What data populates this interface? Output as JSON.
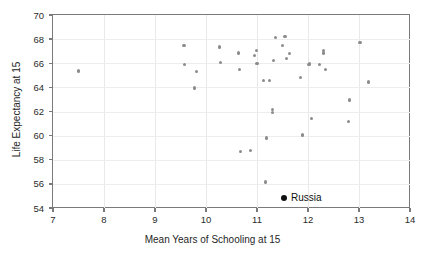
{
  "chart_data": {
    "type": "scatter",
    "title": "",
    "xlabel": "Mean Years of Schooling at 15",
    "ylabel": "Life Expectancy at 15",
    "xlim": [
      7,
      14
    ],
    "ylim": [
      54,
      70
    ],
    "xticks": [
      7,
      8,
      9,
      10,
      11,
      12,
      13,
      14
    ],
    "yticks": [
      54,
      56,
      58,
      60,
      62,
      64,
      66,
      68,
      70
    ],
    "grid": true,
    "legend": "none",
    "marker_color": "#8c8c8c",
    "highlight_color": "#111111",
    "annotations": [
      {
        "label": "Russia",
        "x": 11.53,
        "y": 54.8
      }
    ],
    "series": [
      {
        "name": "countries",
        "points": [
          [
            7.5,
            65.35
          ],
          [
            9.57,
            67.45
          ],
          [
            9.58,
            65.9
          ],
          [
            9.77,
            63.95
          ],
          [
            9.82,
            65.3
          ],
          [
            10.26,
            67.35
          ],
          [
            10.28,
            66.05
          ],
          [
            10.64,
            66.85
          ],
          [
            10.66,
            65.45
          ],
          [
            10.67,
            58.7
          ],
          [
            10.88,
            58.75
          ],
          [
            10.95,
            66.65
          ],
          [
            10.99,
            67.05
          ],
          [
            11.0,
            66.0
          ],
          [
            11.13,
            64.6
          ],
          [
            11.16,
            56.15
          ],
          [
            11.19,
            59.8
          ],
          [
            11.24,
            64.6
          ],
          [
            11.31,
            62.15
          ],
          [
            11.31,
            61.9
          ],
          [
            11.33,
            66.25
          ],
          [
            11.36,
            68.15
          ],
          [
            11.5,
            67.5
          ],
          [
            11.55,
            68.25
          ],
          [
            11.58,
            66.4
          ],
          [
            11.63,
            66.8
          ],
          [
            11.86,
            64.85
          ],
          [
            11.89,
            60.05
          ],
          [
            12.02,
            65.9
          ],
          [
            12.03,
            66.0
          ],
          [
            12.07,
            61.4
          ],
          [
            12.22,
            65.9
          ],
          [
            12.3,
            67.05
          ],
          [
            12.3,
            66.85
          ],
          [
            12.35,
            65.45
          ],
          [
            12.79,
            61.15
          ],
          [
            12.81,
            62.95
          ],
          [
            13.02,
            67.7
          ],
          [
            13.18,
            64.45
          ]
        ]
      }
    ]
  }
}
